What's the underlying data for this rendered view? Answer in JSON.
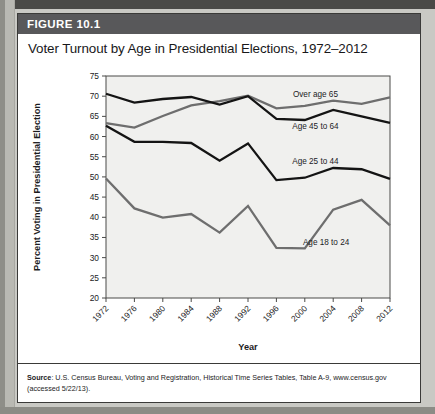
{
  "figure": {
    "banner_label": "FIGURE 10.1",
    "title": "Voter Turnout by Age in Presidential Elections, 1972–2012"
  },
  "source": {
    "label": "Source",
    "text": ": U.S. Census Bureau, Voting and Registration, Historical Time Series Tables, Table A-9, www.census.gov (accessed 5/22/13)."
  },
  "chart_data": {
    "type": "line",
    "title": "Voter Turnout by Age in Presidential Elections, 1972–2012",
    "xlabel": "Year",
    "ylabel": "Percent Voting in Presidential Election",
    "x": [
      1972,
      1976,
      1980,
      1984,
      1988,
      1992,
      1996,
      2000,
      2004,
      2008,
      2012
    ],
    "categories": [
      "1972",
      "1976",
      "1980",
      "1984",
      "1988",
      "1992",
      "1996",
      "2000",
      "2004",
      "2008",
      "2012"
    ],
    "xlim": [
      1972,
      2012
    ],
    "ylim": [
      20,
      75
    ],
    "yticks": [
      20,
      25,
      30,
      35,
      40,
      45,
      50,
      55,
      60,
      65,
      70,
      75
    ],
    "grid": false,
    "legend": "inline-labels",
    "series": [
      {
        "name": "Over age 65",
        "color": "#6e6e6e",
        "label_text": "Over age 65",
        "values": [
          63.3,
          62.2,
          65.1,
          67.7,
          68.8,
          70.1,
          67.0,
          67.6,
          68.9,
          68.1,
          69.7
        ]
      },
      {
        "name": "Age 45 to 64",
        "color": "#141414",
        "label_text": "Age 45 to 64",
        "values": [
          70.6,
          68.4,
          69.3,
          69.8,
          67.9,
          70.0,
          64.4,
          64.1,
          66.6,
          65.0,
          63.4
        ]
      },
      {
        "name": "Age 25 to 44",
        "color": "#141414",
        "label_text": "Age 25 to 44",
        "values": [
          62.7,
          58.7,
          58.7,
          58.4,
          54.0,
          58.3,
          49.2,
          49.8,
          52.2,
          51.9,
          49.5
        ]
      },
      {
        "name": "Age 18 to 24",
        "color": "#6e6e6e",
        "label_text": "Age 18 to 24",
        "values": [
          49.6,
          42.2,
          39.9,
          40.8,
          36.2,
          42.8,
          32.4,
          32.3,
          41.9,
          44.3,
          38.0
        ]
      }
    ]
  }
}
